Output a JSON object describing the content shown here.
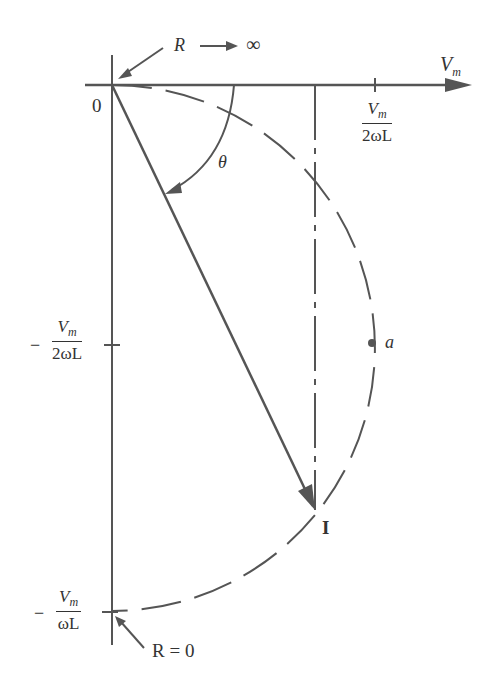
{
  "diagram": {
    "type": "phasor-locus",
    "colors": {
      "ink": "#555555",
      "text": "#333333",
      "background": "#ffffff"
    },
    "labels": {
      "r_infinity_R": "R",
      "r_infinity_inf": "∞",
      "x_axis_V": "V",
      "x_axis_sub": "m",
      "origin": "0",
      "x_tick_num_V": "V",
      "x_tick_num_sub": "m",
      "x_tick_den": "2ωL",
      "theta": "θ",
      "y_mid_minus": "−",
      "y_mid_num_V": "V",
      "y_mid_num_sub": "m",
      "y_mid_den": "2ωL",
      "point_a": "a",
      "current": "I",
      "y_bot_minus": "−",
      "y_bot_num_V": "V",
      "y_bot_num_sub": "m",
      "y_bot_den": "ωL",
      "r_zero": "R = 0"
    },
    "geometry": {
      "origin": [
        112,
        85
      ],
      "circle_center": [
        112,
        348
      ],
      "circle_radius": 263,
      "point_a": [
        372,
        343
      ],
      "current_tip": [
        315,
        510
      ],
      "bottom_point": [
        112,
        612
      ]
    }
  }
}
